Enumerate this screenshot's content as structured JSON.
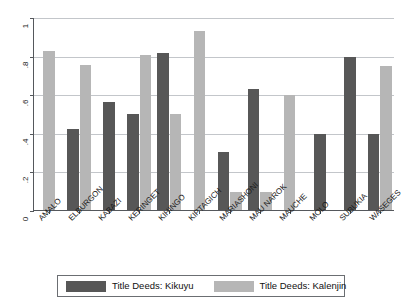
{
  "chart_data": {
    "type": "bar",
    "title": "",
    "subtitle": "",
    "xlabel": "",
    "ylabel": "",
    "ylim": [
      0,
      1
    ],
    "ytick_labels": [
      "0",
      ".2",
      ".4",
      ".6",
      ".8",
      "1"
    ],
    "ytick_values": [
      0,
      0.2,
      0.4,
      0.6,
      0.8,
      1
    ],
    "grid": true,
    "legend_position": "bottom",
    "categories": [
      "AMALO",
      "ELBURGON",
      "KABAZI",
      "KERINGET",
      "KIHINGO",
      "KIPTAGICH",
      "MARIASHONI",
      "MAU NAROK",
      "MAUCHE",
      "MOLO",
      "SUBUKIA",
      "WASEGES"
    ],
    "series": [
      {
        "name": "Title Deeds: Kikuyu",
        "color": "#575757",
        "values": [
          null,
          0.42,
          0.56,
          0.5,
          0.815,
          null,
          0.3,
          0.625,
          null,
          0.395,
          0.795,
          0.395
        ]
      },
      {
        "name": "Title Deeds: Kalenjin",
        "color": "#b6b6b6",
        "values": [
          0.825,
          0.75,
          null,
          0.805,
          0.495,
          0.93,
          0.095,
          0.095,
          0.595,
          null,
          null,
          0.745
        ]
      }
    ]
  },
  "legend": {
    "entries": [
      {
        "label": "Title Deeds: Kikuyu",
        "color": "#575757"
      },
      {
        "label": "Title Deeds: Kalenjin",
        "color": "#b6b6b6"
      }
    ]
  },
  "colors": {
    "kikuyu": "#575757",
    "kalenjin": "#b6b6b6",
    "axis": "#55585c",
    "gridline": "#c3c6ca",
    "background": "#ffffff"
  }
}
